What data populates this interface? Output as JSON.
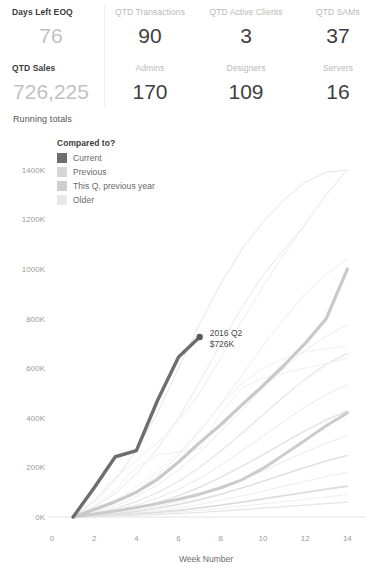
{
  "kpis": {
    "row1": [
      {
        "label": "Days Left EOQ",
        "value": "76",
        "label_style": "strong",
        "value_style": "light"
      },
      {
        "label": "QTD Transactions",
        "value": "90",
        "label_style": "muted",
        "value_style": "dark"
      },
      {
        "label": "QTD Active Clients",
        "value": "3",
        "label_style": "muted",
        "value_style": "dark"
      },
      {
        "label": "QTD SAMs",
        "value": "37",
        "label_style": "muted",
        "value_style": "dark"
      }
    ],
    "row2": [
      {
        "label": "QTD Sales",
        "value": "726,225",
        "label_style": "strong",
        "value_style": "light"
      },
      {
        "label": "Admins",
        "value": "170",
        "label_style": "muted",
        "value_style": "dark"
      },
      {
        "label": "Designers",
        "value": "109",
        "label_style": "muted",
        "value_style": "dark"
      },
      {
        "label": "Servers",
        "value": "16",
        "label_style": "muted",
        "value_style": "dark"
      }
    ]
  },
  "chart_title": "Running totals",
  "legend": {
    "title": "Compared to?",
    "items": [
      {
        "label": "Current",
        "color": "#6e6e6e"
      },
      {
        "label": "Previous",
        "color": "#d6d6d6"
      },
      {
        "label": "This Q, previous year",
        "color": "#cfcfcf"
      },
      {
        "label": "Older",
        "color": "#e9e9e9"
      }
    ]
  },
  "chart_data": {
    "type": "line",
    "title": "Running totals",
    "xlabel": "Week Number",
    "ylabel": "",
    "xlim": [
      0,
      14.6
    ],
    "ylim": [
      0,
      1460
    ],
    "grid": false,
    "legend_position": "top-left",
    "xticks": [
      0,
      2,
      4,
      6,
      8,
      10,
      12,
      14
    ],
    "yticks": [
      0,
      200,
      400,
      600,
      800,
      1000,
      1200,
      1400
    ],
    "ytick_labels": [
      "0K",
      "200K",
      "400K",
      "600K",
      "800K",
      "1000K",
      "1200K",
      "1400K"
    ],
    "y_units": "thousands of dollars",
    "annotations": [
      {
        "line1": "2016 Q2",
        "line2": "$726K",
        "x": 7,
        "y": 726
      }
    ],
    "series": [
      {
        "name": "Current",
        "group": "Current",
        "color": "#6e6e6e",
        "width": 3.4,
        "opacity": 1,
        "x": [
          1,
          2,
          3,
          4,
          5,
          6,
          7
        ],
        "values": [
          0,
          118,
          243,
          268,
          470,
          645,
          726
        ]
      },
      {
        "name": "Previous",
        "group": "Previous",
        "color": "#c9c9c9",
        "width": 3.2,
        "opacity": 1,
        "x": [
          1,
          2,
          3,
          4,
          5,
          6,
          7,
          8,
          9,
          10,
          11,
          12,
          13,
          14
        ],
        "values": [
          0,
          30,
          62,
          100,
          152,
          222,
          300,
          372,
          452,
          530,
          612,
          700,
          800,
          1000
        ]
      },
      {
        "name": "This Q, previous year",
        "group": "This Q, previous year",
        "color": "#cccccc",
        "width": 3.0,
        "opacity": 1,
        "x": [
          1,
          2,
          3,
          4,
          5,
          6,
          7,
          8,
          9,
          10,
          11,
          12,
          13,
          14
        ],
        "values": [
          0,
          12,
          24,
          38,
          54,
          72,
          92,
          118,
          150,
          196,
          252,
          310,
          368,
          420
        ]
      },
      {
        "name": "Older 1",
        "group": "Older",
        "color": "#e4e4e4",
        "width": 1.0,
        "opacity": 1,
        "x": [
          1,
          2,
          3,
          4,
          5,
          6,
          7,
          8,
          9,
          10,
          11,
          12,
          13,
          14
        ],
        "values": [
          0,
          60,
          150,
          270,
          420,
          600,
          780,
          940,
          1080,
          1190,
          1280,
          1350,
          1390,
          1400
        ]
      },
      {
        "name": "Older 2",
        "group": "Older",
        "color": "#e8e8e8",
        "width": 1.0,
        "opacity": 1,
        "x": [
          1,
          2,
          3,
          4,
          5,
          6,
          7,
          8,
          9,
          10,
          11,
          12,
          13,
          14
        ],
        "values": [
          0,
          40,
          95,
          175,
          275,
          400,
          545,
          700,
          845,
          975,
          1080,
          1180,
          1300,
          1400
        ]
      },
      {
        "name": "Older 3",
        "group": "Older",
        "color": "#ececec",
        "width": 1.0,
        "opacity": 1,
        "x": [
          1,
          2,
          3,
          4,
          5,
          6,
          7,
          8,
          9,
          10,
          11,
          12,
          13,
          14
        ],
        "values": [
          0,
          22,
          56,
          104,
          168,
          248,
          345,
          455,
          570,
          690,
          800,
          900,
          980,
          1040
        ]
      },
      {
        "name": "Older 4",
        "group": "Older",
        "color": "#ededed",
        "width": 1.0,
        "opacity": 1,
        "x": [
          1,
          2,
          3,
          4,
          5,
          6,
          7,
          8,
          9,
          10,
          11,
          12,
          13,
          14
        ],
        "values": [
          0,
          18,
          44,
          82,
          130,
          190,
          262,
          344,
          430,
          520,
          600,
          672,
          730,
          775
        ]
      },
      {
        "name": "Older 5",
        "group": "Older",
        "color": "#e6e6e6",
        "width": 1.2,
        "opacity": 1,
        "x": [
          1,
          2,
          3,
          4,
          5,
          6,
          7,
          8,
          9,
          10,
          11,
          12,
          13,
          14
        ],
        "values": [
          0,
          14,
          34,
          62,
          98,
          144,
          200,
          266,
          338,
          412,
          486,
          556,
          616,
          660
        ]
      },
      {
        "name": "Older 6",
        "group": "Older",
        "color": "#e9e9e9",
        "width": 1.0,
        "opacity": 1,
        "x": [
          1,
          2,
          3,
          4,
          5,
          6,
          7,
          8,
          9,
          10,
          11,
          12,
          13,
          14
        ],
        "values": [
          0,
          10,
          26,
          48,
          76,
          112,
          156,
          208,
          266,
          326,
          386,
          444,
          494,
          534
        ]
      },
      {
        "name": "Older 7",
        "group": "Older",
        "color": "#e2e2e2",
        "width": 1.4,
        "opacity": 1,
        "x": [
          1,
          2,
          3,
          4,
          5,
          6,
          7,
          8,
          9,
          10,
          11,
          12,
          13,
          14
        ],
        "values": [
          0,
          8,
          20,
          36,
          58,
          86,
          120,
          160,
          204,
          252,
          300,
          348,
          392,
          428
        ]
      },
      {
        "name": "Older 8",
        "group": "Older",
        "color": "#ebebeb",
        "width": 1.0,
        "opacity": 1,
        "x": [
          1,
          2,
          3,
          4,
          5,
          6,
          7,
          8,
          9,
          10,
          11,
          12,
          13,
          14
        ],
        "values": [
          0,
          6,
          15,
          27,
          43,
          63,
          88,
          117,
          150,
          186,
          224,
          262,
          298,
          328
        ]
      },
      {
        "name": "Older 9",
        "group": "Older",
        "color": "#e0e0e0",
        "width": 1.6,
        "opacity": 1,
        "x": [
          1,
          2,
          3,
          4,
          5,
          6,
          7,
          8,
          9,
          10,
          11,
          12,
          13,
          14
        ],
        "values": [
          0,
          5,
          12,
          22,
          35,
          51,
          70,
          92,
          117,
          144,
          172,
          200,
          226,
          248
        ]
      },
      {
        "name": "Older 10",
        "group": "Older",
        "color": "#eeeeee",
        "width": 1.0,
        "opacity": 1,
        "x": [
          1,
          2,
          3,
          4,
          5,
          6,
          7,
          8,
          9,
          10,
          11,
          12,
          13,
          14
        ],
        "values": [
          0,
          4,
          9,
          16,
          25,
          37,
          51,
          67,
          85,
          104,
          124,
          144,
          163,
          180
        ]
      },
      {
        "name": "Older 11",
        "group": "Older",
        "color": "#dddddd",
        "width": 1.8,
        "opacity": 1,
        "x": [
          1,
          2,
          3,
          4,
          5,
          6,
          7,
          8,
          9,
          10,
          11,
          12,
          13,
          14
        ],
        "values": [
          0,
          3,
          7,
          12,
          19,
          27,
          37,
          48,
          60,
          73,
          86,
          99,
          112,
          124
        ]
      },
      {
        "name": "Older 12",
        "group": "Older",
        "color": "#efefef",
        "width": 1.0,
        "opacity": 1,
        "x": [
          1,
          2,
          3,
          4,
          5,
          6,
          7,
          8,
          9,
          10,
          11,
          12,
          13,
          14
        ],
        "values": [
          0,
          2,
          5,
          9,
          14,
          20,
          27,
          35,
          44,
          53,
          62,
          72,
          81,
          90
        ]
      },
      {
        "name": "Older 13",
        "group": "Older",
        "color": "#e5e5e5",
        "width": 1.2,
        "opacity": 1,
        "x": [
          1,
          2,
          3,
          4,
          5,
          6,
          7,
          8,
          9,
          10,
          11,
          12,
          13,
          14
        ],
        "values": [
          0,
          2,
          4,
          7,
          10,
          14,
          19,
          24,
          30,
          36,
          42,
          48,
          54,
          60
        ]
      },
      {
        "name": "Older 14",
        "group": "Older",
        "color": "#f0f0f0",
        "width": 1.0,
        "opacity": 1,
        "x": [
          1,
          2,
          3,
          4,
          5,
          6,
          7,
          8,
          9,
          10,
          11,
          12,
          13,
          14
        ],
        "values": [
          0,
          45,
          110,
          200,
          250,
          262,
          275,
          420,
          520,
          560,
          580,
          600,
          620,
          640
        ]
      },
      {
        "name": "Older 15",
        "group": "Older",
        "color": "#ededed",
        "width": 1.0,
        "opacity": 1,
        "x": [
          1,
          2,
          3,
          4,
          5,
          6,
          7,
          8,
          9,
          10,
          11,
          12,
          13,
          14
        ],
        "values": [
          0,
          70,
          160,
          230,
          300,
          390,
          500,
          640,
          790,
          930,
          1060,
          1180,
          1300,
          1400
        ]
      },
      {
        "name": "Older 16",
        "group": "Older",
        "color": "#f1f1f1",
        "width": 1.0,
        "opacity": 1,
        "x": [
          1,
          2,
          3,
          4,
          5,
          6,
          7,
          8,
          9,
          10,
          11,
          12,
          13,
          14
        ],
        "values": [
          0,
          30,
          70,
          120,
          185,
          260,
          350,
          450,
          540,
          600,
          640,
          665,
          680,
          690
        ]
      }
    ]
  }
}
